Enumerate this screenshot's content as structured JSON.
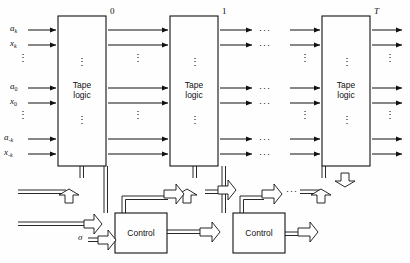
{
  "figure": {
    "background": "#fefefe",
    "line_color": "#111111"
  },
  "stages": [
    {
      "id": "stage-0",
      "number": "0",
      "box_line1": "Tape",
      "box_line2": "logic"
    },
    {
      "id": "stage-1",
      "number": "1",
      "box_line1": "Tape",
      "box_line2": "logic"
    },
    {
      "id": "stage-T",
      "number": "T",
      "number_italic": true,
      "box_line1": "Tape",
      "box_line2": "logic"
    }
  ],
  "input_labels": [
    {
      "base": "a",
      "sub": "k"
    },
    {
      "base": "x",
      "sub": "k"
    },
    {
      "base": "a",
      "sub": "0"
    },
    {
      "base": "x",
      "sub": "0"
    },
    {
      "base": "a",
      "sub": "-k"
    },
    {
      "base": "x",
      "sub": "-k"
    }
  ],
  "control": {
    "label": "Control",
    "count": 2,
    "sigma_label": "σ"
  },
  "ellipses": {
    "vertical": "⋮",
    "horizontal": "···"
  }
}
